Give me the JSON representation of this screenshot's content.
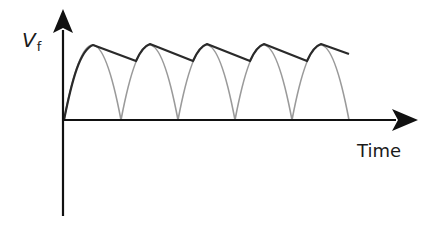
{
  "diagram": {
    "y_axis": {
      "label_main": "V",
      "label_sub": "f"
    },
    "x_axis": {
      "label": "Time"
    },
    "colors": {
      "axis": "#111111",
      "rectified_wave": "#9a9a9a",
      "smoothed_envelope": "#2a2a2a"
    },
    "waveform": {
      "type": "full-wave rectified sine with capacitor smoothing",
      "half_cycles_shown": 5
    }
  }
}
